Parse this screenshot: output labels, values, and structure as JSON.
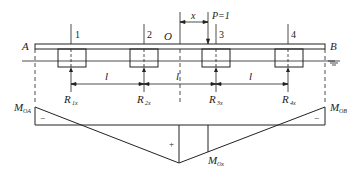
{
  "figure": {
    "ends": {
      "left": "A",
      "right": "B"
    },
    "origin_label": "O",
    "load": {
      "label": "P=1",
      "position_label": "x"
    },
    "columns": [
      {
        "number": "1",
        "reaction": "R",
        "reaction_sub": "1x"
      },
      {
        "number": "2",
        "reaction": "R",
        "reaction_sub": "2x"
      },
      {
        "number": "3",
        "reaction": "R",
        "reaction_sub": "3x"
      },
      {
        "number": "4",
        "reaction": "R",
        "reaction_sub": "4x"
      }
    ],
    "spans": [
      "l",
      "l",
      "l"
    ],
    "moment_diagram": {
      "left_label": "M",
      "left_sub": "OA",
      "right_label": "M",
      "right_sub": "OB",
      "mid_label": "M",
      "mid_sub": "Ox",
      "signs": {
        "left": "−",
        "center": "+",
        "right": "−"
      }
    }
  }
}
